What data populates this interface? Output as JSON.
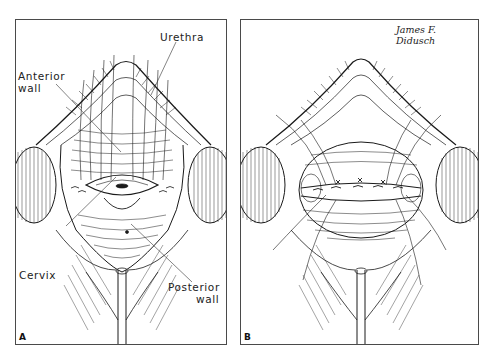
{
  "figure": {
    "panels": [
      {
        "id": "A",
        "letter": "A",
        "labels": {
          "urethra": "Urethra",
          "anterior_wall_line1": "Anterior",
          "anterior_wall_line2": "wall",
          "cervix": "Cervix",
          "posterior_wall_line1": "Posterior",
          "posterior_wall_line2": "wall"
        }
      },
      {
        "id": "B",
        "letter": "B",
        "signature": "James F. Didusch"
      }
    ],
    "style": {
      "ink": "#1a1a1a",
      "frame": "#4a4a4a",
      "paper": "#ffffff"
    }
  }
}
